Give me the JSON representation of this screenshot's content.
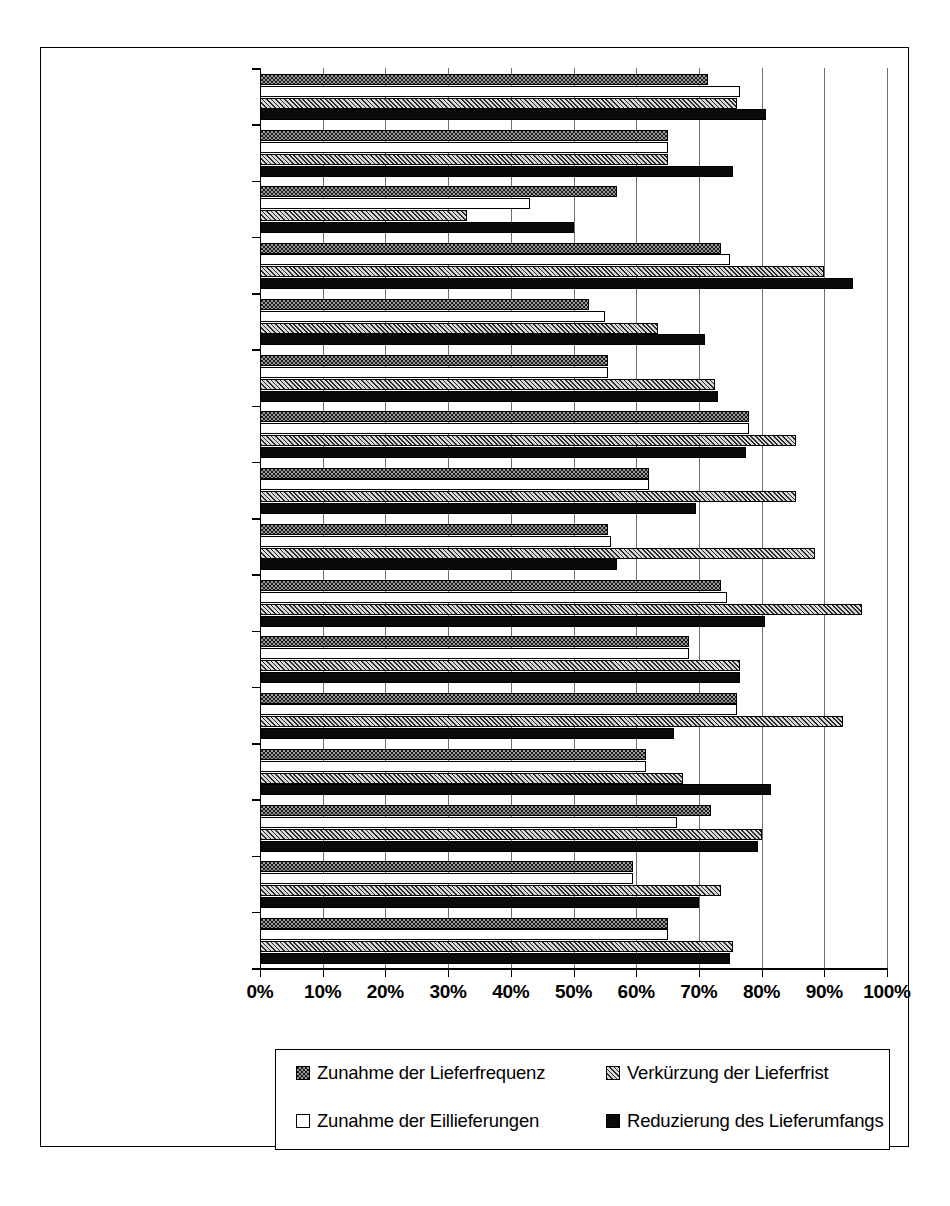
{
  "chart_data": {
    "type": "bar",
    "orientation": "horizontal",
    "title": "",
    "xlabel": "",
    "ylabel": "",
    "xlim": [
      0,
      100
    ],
    "xtick_labels": [
      "0%",
      "10%",
      "20%",
      "30%",
      "40%",
      "50%",
      "60%",
      "70%",
      "80%",
      "90%",
      "100%"
    ],
    "xticks": [
      0,
      10,
      20,
      30,
      40,
      50,
      60,
      70,
      80,
      90,
      100
    ],
    "grid": true,
    "legend_position": "bottom",
    "categories": [
      "Papier",
      "Chemie",
      "Öl- und Kohleprodukte",
      "Gummi",
      "Keramik/Steine/Erden",
      "Eisen und Stahl",
      "Nichteisenmetalle",
      "Metallverarbeitung",
      "Maschinenbau",
      "Elektrogeräte",
      "Fahrzeugbau",
      "Präzisionsgeräte",
      "Nahrungsmittel",
      "Textilgewerbe",
      "Sonstige",
      "Industrie gesamt"
    ],
    "series": [
      {
        "name": "Zunahme der Lieferfrequenz",
        "key": "s1",
        "values": [
          71.5,
          65.0,
          57.0,
          73.5,
          52.5,
          55.5,
          78.0,
          62.0,
          55.5,
          73.5,
          68.5,
          76.0,
          61.5,
          72.0,
          59.5,
          65.0
        ]
      },
      {
        "name": "Zunahme der Eillieferungen",
        "key": "s2",
        "values": [
          76.5,
          65.0,
          43.0,
          75.0,
          55.0,
          55.5,
          78.0,
          62.0,
          56.0,
          74.5,
          68.5,
          76.0,
          61.5,
          66.5,
          59.5,
          65.0
        ]
      },
      {
        "name": "Verkürzung der Lieferfrist",
        "key": "s3",
        "values": [
          76.0,
          65.0,
          33.0,
          90.0,
          63.5,
          72.5,
          85.5,
          85.5,
          88.5,
          96.0,
          76.5,
          93.0,
          67.5,
          80.0,
          73.5,
          75.5
        ]
      },
      {
        "name": "Reduzierung des Lieferumfangs",
        "key": "s4",
        "values": [
          80.7,
          75.5,
          50.0,
          94.5,
          71.0,
          73.0,
          77.5,
          69.5,
          57.0,
          80.5,
          76.5,
          66.0,
          81.5,
          79.5,
          70.0,
          75.0
        ]
      }
    ]
  },
  "legend": {
    "items": [
      {
        "label": "Zunahme der Lieferfrequenz",
        "key": "s1"
      },
      {
        "label": "Verkürzung der Lieferfrist",
        "key": "s3"
      },
      {
        "label": "Zunahme der Eillieferungen",
        "key": "s2"
      },
      {
        "label": "Reduzierung des Lieferumfangs",
        "key": "s4"
      }
    ]
  },
  "colors": {
    "axis": "#000000",
    "gridline": "#6f6f6f",
    "series_1": "#1b1b1b",
    "series_2": "#ffffff",
    "series_3": "#8a8a8a",
    "series_4": "#0a0a0a",
    "background": "#ffffff"
  }
}
